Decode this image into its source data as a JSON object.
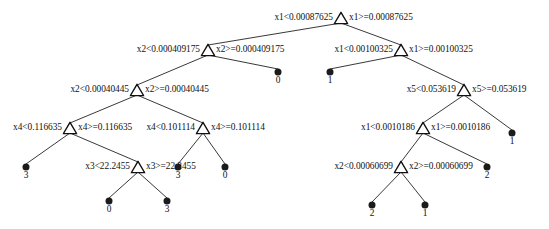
{
  "figure": {
    "type": "decision-tree-diagram",
    "width": 549,
    "height": 229,
    "background_color": "#ffffff",
    "node_fill_color": "#ffffff",
    "node_stroke_color": "#111111",
    "leaf_color": "#1b1b1b",
    "edge_color": "#222222"
  },
  "nodes": [
    {
      "id": "n0",
      "kind": "split",
      "x": 341,
      "y": 18,
      "variable": "x1",
      "threshold": "0.00087625",
      "left_label": "x1<0.00087625",
      "right_label": "x1>=0.00087625"
    },
    {
      "id": "n1",
      "kind": "split",
      "x": 208,
      "y": 50,
      "variable": "x2",
      "threshold": "0.000409175",
      "left_label": "x2<0.000409175",
      "right_label": "x2>=0.000409175"
    },
    {
      "id": "n2",
      "kind": "split",
      "x": 137,
      "y": 90,
      "variable": "x2",
      "threshold": "0.00040445",
      "left_label": "x2<0.00040445",
      "right_label": "x2>=0.00040445"
    },
    {
      "id": "n3",
      "kind": "split",
      "x": 70,
      "y": 128,
      "variable": "x4",
      "threshold": "0.116635",
      "left_label": "x4<0.116635",
      "right_label": "x4>=0.116635"
    },
    {
      "id": "n4",
      "kind": "split",
      "x": 203,
      "y": 128,
      "variable": "x4",
      "threshold": "0.101114",
      "left_label": "x4<0.101114",
      "right_label": "x4>=0.101114"
    },
    {
      "id": "n5",
      "kind": "split",
      "x": 138,
      "y": 167,
      "variable": "x3",
      "threshold": "22.2455",
      "left_label": "x3<22.2455",
      "right_label": "x3>=22.2455"
    },
    {
      "id": "n6",
      "kind": "split",
      "x": 401,
      "y": 50,
      "variable": "x1",
      "threshold": "0.00100325",
      "left_label": "x1<0.00100325",
      "right_label": "x1>=0.00100325"
    },
    {
      "id": "n7",
      "kind": "split",
      "x": 464,
      "y": 90,
      "variable": "x5",
      "threshold": "0.053619",
      "left_label": "x5<0.053619",
      "right_label": "x5>=0.053619"
    },
    {
      "id": "n8",
      "kind": "split",
      "x": 423,
      "y": 128,
      "variable": "x1",
      "threshold": "0.0010186",
      "left_label": "x1<0.0010186",
      "right_label": "x1>=0.0010186"
    },
    {
      "id": "n9",
      "kind": "split",
      "x": 401,
      "y": 167,
      "variable": "x2",
      "threshold": "0.00060699",
      "left_label": "x2<0.00060699",
      "right_label": "x2>=0.00060699"
    }
  ],
  "leaves": [
    {
      "id": "l0",
      "x": 278,
      "y": 72,
      "value": "0"
    },
    {
      "id": "l1",
      "x": 330,
      "y": 72,
      "value": "1"
    },
    {
      "id": "l2",
      "x": 26,
      "y": 167,
      "value": "3"
    },
    {
      "id": "l3",
      "x": 109,
      "y": 201,
      "value": "0"
    },
    {
      "id": "l4",
      "x": 167,
      "y": 201,
      "value": "3"
    },
    {
      "id": "l5",
      "x": 178,
      "y": 167,
      "value": "3"
    },
    {
      "id": "l6",
      "x": 225,
      "y": 167,
      "value": "0"
    },
    {
      "id": "l7",
      "x": 512,
      "y": 133,
      "value": "1"
    },
    {
      "id": "l8",
      "x": 487,
      "y": 167,
      "value": "2"
    },
    {
      "id": "l9",
      "x": 372,
      "y": 205,
      "value": "2"
    },
    {
      "id": "l10",
      "x": 425,
      "y": 205,
      "value": "1"
    }
  ],
  "edges": [
    {
      "from": "n0",
      "to": "n1"
    },
    {
      "from": "n0",
      "to": "n6"
    },
    {
      "from": "n1",
      "to": "n2"
    },
    {
      "from": "n1",
      "to": "l0"
    },
    {
      "from": "n2",
      "to": "n3"
    },
    {
      "from": "n2",
      "to": "n4"
    },
    {
      "from": "n3",
      "to": "l2"
    },
    {
      "from": "n3",
      "to": "n5"
    },
    {
      "from": "n4",
      "to": "l5"
    },
    {
      "from": "n4",
      "to": "l6"
    },
    {
      "from": "n5",
      "to": "l3"
    },
    {
      "from": "n5",
      "to": "l4"
    },
    {
      "from": "n6",
      "to": "l1"
    },
    {
      "from": "n6",
      "to": "n7"
    },
    {
      "from": "n7",
      "to": "n8"
    },
    {
      "from": "n7",
      "to": "l7"
    },
    {
      "from": "n8",
      "to": "n9"
    },
    {
      "from": "n8",
      "to": "l8"
    },
    {
      "from": "n9",
      "to": "l9"
    },
    {
      "from": "n9",
      "to": "l10"
    }
  ]
}
